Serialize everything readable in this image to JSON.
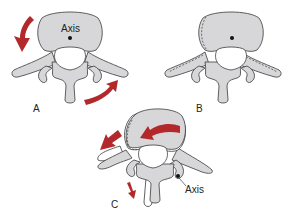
{
  "figure": {
    "panels": [
      {
        "id": "A",
        "label": "A",
        "axis_label": "Axis",
        "description": "Vertebra with rotation axis in vertebral body; arrows indicate rotation"
      },
      {
        "id": "B",
        "label": "B",
        "description": "Vertebra with dashed outline showing displaced position"
      },
      {
        "id": "C",
        "label": "C",
        "axis_label": "Axis",
        "description": "Rotated vertebra with axis at facet joint; arrows indicate rotation direction"
      }
    ],
    "colors": {
      "bone_fill": "#d7d7d9",
      "outline": "#3a3a3a",
      "arrow": "#b3282b",
      "background": "#ffffff"
    }
  }
}
